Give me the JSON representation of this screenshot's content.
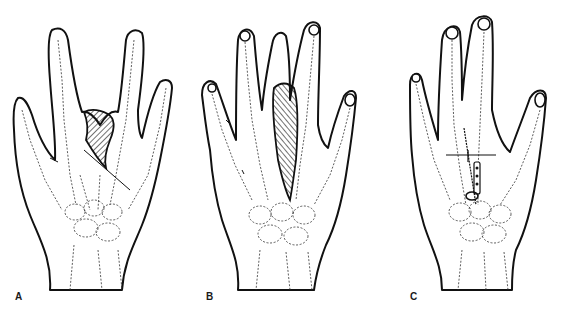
{
  "figure": {
    "panels": [
      {
        "id": "A",
        "label": "A",
        "description": "Hand dorsal view with hatched triangular defect between middle and ring fingers"
      },
      {
        "id": "B",
        "label": "B",
        "description": "Hand dorsal view with hatched elongated flap along central ray"
      },
      {
        "id": "C",
        "label": "C",
        "description": "Hand dorsal view after repair with K-wire fixation and plate"
      }
    ],
    "colors": {
      "ink": "#111111",
      "background": "#ffffff"
    }
  }
}
